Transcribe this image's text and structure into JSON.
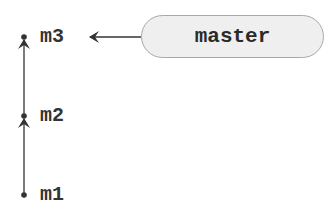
{
  "diagram": {
    "commits": [
      {
        "id": "m3",
        "label": "m3"
      },
      {
        "id": "m2",
        "label": "m2"
      },
      {
        "id": "m1",
        "label": "m1"
      }
    ],
    "branch": {
      "label": "master",
      "points_to": "m3"
    },
    "edges": [
      {
        "from": "m1",
        "to": "m2"
      },
      {
        "from": "m2",
        "to": "m3"
      }
    ],
    "colors": {
      "line": "#333333",
      "pill_fill": "#efefef",
      "pill_border": "#a8a8a8"
    }
  }
}
